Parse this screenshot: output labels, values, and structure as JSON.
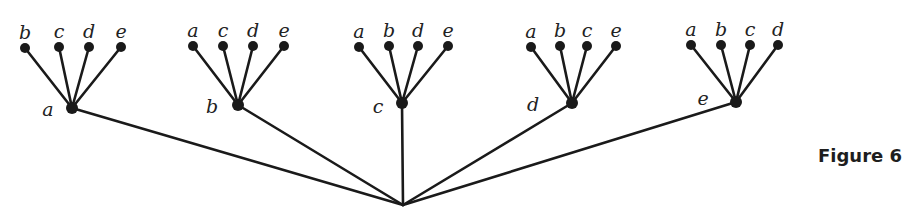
{
  "caption": "Figure 6",
  "colors": {
    "ink": "#1a1a1a",
    "background": "#ffffff"
  },
  "root": {
    "x": 403,
    "y": 205
  },
  "groups": [
    {
      "label": "a",
      "hub": {
        "x": 72,
        "y": 108
      },
      "label_pos": {
        "x": 48,
        "y": 116
      },
      "leaves": [
        {
          "label": "b",
          "x": 25,
          "y": 48
        },
        {
          "label": "c",
          "x": 59,
          "y": 47
        },
        {
          "label": "d",
          "x": 89,
          "y": 47
        },
        {
          "label": "e",
          "x": 121,
          "y": 47
        }
      ]
    },
    {
      "label": "b",
      "hub": {
        "x": 238,
        "y": 105
      },
      "label_pos": {
        "x": 212,
        "y": 113
      },
      "leaves": [
        {
          "label": "a",
          "x": 193,
          "y": 46
        },
        {
          "label": "c",
          "x": 223,
          "y": 46
        },
        {
          "label": "d",
          "x": 253,
          "y": 46
        },
        {
          "label": "e",
          "x": 284,
          "y": 46
        }
      ]
    },
    {
      "label": "c",
      "hub": {
        "x": 402,
        "y": 103
      },
      "label_pos": {
        "x": 378,
        "y": 113
      },
      "leaves": [
        {
          "label": "a",
          "x": 359,
          "y": 47
        },
        {
          "label": "b",
          "x": 389,
          "y": 46
        },
        {
          "label": "d",
          "x": 418,
          "y": 46
        },
        {
          "label": "e",
          "x": 448,
          "y": 46
        }
      ]
    },
    {
      "label": "d",
      "hub": {
        "x": 572,
        "y": 103
      },
      "label_pos": {
        "x": 533,
        "y": 111
      },
      "leaves": [
        {
          "label": "a",
          "x": 531,
          "y": 47
        },
        {
          "label": "b",
          "x": 560,
          "y": 46
        },
        {
          "label": "c",
          "x": 587,
          "y": 46
        },
        {
          "label": "e",
          "x": 616,
          "y": 46
        }
      ]
    },
    {
      "label": "e",
      "hub": {
        "x": 736,
        "y": 102
      },
      "label_pos": {
        "x": 703,
        "y": 105
      },
      "leaves": [
        {
          "label": "a",
          "x": 691,
          "y": 45
        },
        {
          "label": "b",
          "x": 721,
          "y": 45
        },
        {
          "label": "c",
          "x": 750,
          "y": 45
        },
        {
          "label": "d",
          "x": 778,
          "y": 45
        }
      ]
    }
  ]
}
